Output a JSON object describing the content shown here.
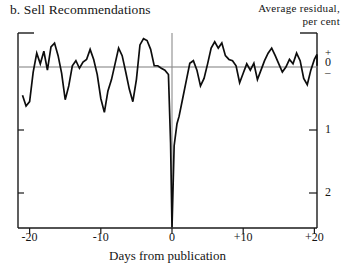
{
  "panel": {
    "label": "b. Sell Recommendations"
  },
  "axis_note": {
    "line1": "Average residual,",
    "line2": "per cent"
  },
  "chart_data": {
    "type": "line",
    "title": "b. Sell Recommendations",
    "subtitle": "",
    "xlabel": "Days from publication",
    "ylabel": "Average residual, per cent",
    "xlim": [
      -21,
      21
    ],
    "ylim": [
      -2.6,
      0.6
    ],
    "grid": false,
    "legend": null,
    "zero_reference_line": 0,
    "event_marker_x": 0,
    "xticks": [
      -20,
      -10,
      0,
      10,
      20
    ],
    "xtick_labels": [
      "-20",
      "-10",
      "0",
      "+10",
      "+20"
    ],
    "yticks": [
      0,
      -1,
      -2
    ],
    "ytick_labels": [
      "0",
      "1",
      "2"
    ],
    "ytick_zero_cluster": [
      "+",
      "0",
      "–"
    ],
    "series": [
      {
        "name": "Sell recommendations average residual",
        "x": [
          -21,
          -20.5,
          -20,
          -19.5,
          -19,
          -18.5,
          -18,
          -17.5,
          -17,
          -16.5,
          -16,
          -15.5,
          -15,
          -14.5,
          -14,
          -13.5,
          -13,
          -12.5,
          -12,
          -11.5,
          -11,
          -10.5,
          -10,
          -9.5,
          -9,
          -8.5,
          -8,
          -7.5,
          -7,
          -6.5,
          -6,
          -5.5,
          -5,
          -4.5,
          -4,
          -3.5,
          -3,
          -2.5,
          -2,
          -1.5,
          -1,
          -0.5,
          -0.2,
          0,
          0.3,
          0.7,
          1,
          1.5,
          2,
          2.5,
          3,
          3.5,
          4,
          4.5,
          5,
          5.5,
          6,
          6.5,
          7,
          7.5,
          8,
          8.5,
          9,
          9.5,
          10,
          10.5,
          11,
          11.5,
          12,
          12.5,
          13,
          13.5,
          14,
          14.5,
          15,
          15.5,
          16,
          16.5,
          17,
          17.5,
          18,
          18.5,
          19,
          19.5,
          20,
          20.5,
          21
        ],
        "values": [
          -0.45,
          -0.62,
          -0.55,
          -0.08,
          0.22,
          0.05,
          0.25,
          -0.05,
          0.32,
          0.38,
          0.18,
          -0.1,
          -0.52,
          -0.3,
          0.02,
          0.1,
          -0.02,
          0.08,
          0.12,
          0.28,
          0.12,
          -0.12,
          -0.5,
          -0.72,
          -0.38,
          -0.2,
          0.05,
          0.3,
          0.18,
          -0.08,
          -0.35,
          -0.55,
          -0.2,
          0.35,
          0.45,
          0.42,
          0.28,
          0.02,
          0.02,
          -0.02,
          -0.05,
          -0.12,
          -1.2,
          -2.55,
          -1.25,
          -0.9,
          -0.78,
          -0.5,
          -0.22,
          0.06,
          0.1,
          -0.05,
          -0.3,
          -0.18,
          0.05,
          0.3,
          0.4,
          0.3,
          0.38,
          0.18,
          0.12,
          0.1,
          0.02,
          -0.25,
          -0.1,
          0.05,
          -0.05,
          0.06,
          -0.2,
          -0.05,
          0.1,
          0.22,
          0.3,
          0.18,
          0.05,
          -0.08,
          0.0,
          0.12,
          0.05,
          0.22,
          0.1,
          -0.18,
          -0.28,
          -0.05,
          0.12,
          0.2,
          0.02
        ]
      }
    ],
    "colors": {
      "line": "#0d0d0d",
      "axis": "#1a1a1a",
      "reference_line": "#7d7d7d",
      "event_line": "#8c8c8c",
      "background": "#ffffff"
    }
  }
}
